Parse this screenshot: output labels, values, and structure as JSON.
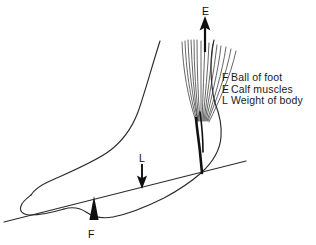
{
  "figure": {
    "background_color": "#ffffff",
    "line_color": "#1a1a1a",
    "width": 316,
    "height": 245
  },
  "legend": {
    "items": [
      {
        "key": "F",
        "text": "Ball of foot"
      },
      {
        "key": "E",
        "text": "Calf muscles"
      },
      {
        "key": "L",
        "text": "Weight of body"
      }
    ]
  },
  "vectors": [
    {
      "id": "E",
      "label": "E",
      "meaning": "Calf muscles",
      "direction": "up",
      "arrow_color": "#101010"
    },
    {
      "id": "L",
      "label": "L",
      "meaning": "Weight of body",
      "direction": "down",
      "arrow_color": "#101010"
    },
    {
      "id": "F",
      "label": "F",
      "meaning": "Ball of foot",
      "direction": "up",
      "marker": "solid-triangle",
      "arrow_color": "#101010"
    }
  ],
  "anatomy": {
    "foot_outline": "side view of human foot and lower leg",
    "muscle_fibers": "calf muscle fiber fan converging to Achilles tendon",
    "tendon": "Achilles tendon attaching at heel",
    "ground_line": "floor / ground reference line"
  }
}
